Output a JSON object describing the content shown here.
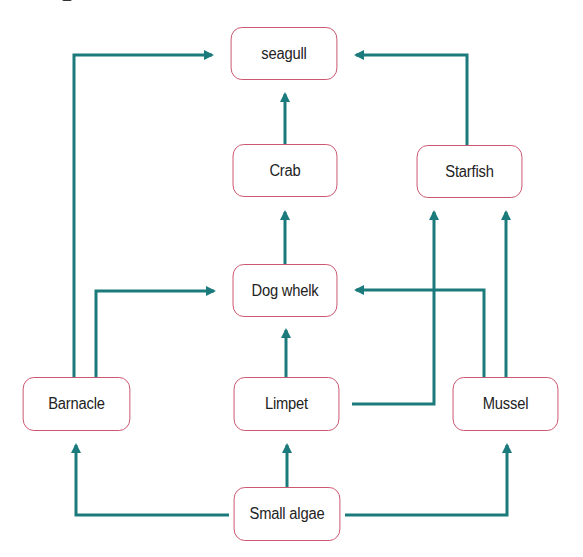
{
  "diagram": {
    "type": "food-web",
    "colors": {
      "arrow": "#1b7a7b",
      "node_border": "#c9506a",
      "node_fill": "#ffffff",
      "text": "#222222"
    },
    "nodes": [
      {
        "id": "seagull",
        "label": "seagull"
      },
      {
        "id": "crab",
        "label": "Crab"
      },
      {
        "id": "starfish",
        "label": "Starfish"
      },
      {
        "id": "dog_whelk",
        "label": "Dog whelk"
      },
      {
        "id": "barnacle",
        "label": "Barnacle"
      },
      {
        "id": "limpet",
        "label": "Limpet"
      },
      {
        "id": "mussel",
        "label": "Mussel"
      },
      {
        "id": "small_algae",
        "label": "Small algae"
      }
    ],
    "edges": [
      {
        "from": "Barnacle",
        "to": "seagull"
      },
      {
        "from": "Crab",
        "to": "seagull"
      },
      {
        "from": "Starfish",
        "to": "seagull"
      },
      {
        "from": "Dog whelk",
        "to": "Crab"
      },
      {
        "from": "Barnacle",
        "to": "Dog whelk"
      },
      {
        "from": "Limpet",
        "to": "Dog whelk"
      },
      {
        "from": "Mussel",
        "to": "Dog whelk"
      },
      {
        "from": "Limpet",
        "to": "Starfish"
      },
      {
        "from": "Mussel",
        "to": "Starfish"
      },
      {
        "from": "Small algae",
        "to": "Barnacle"
      },
      {
        "from": "Small algae",
        "to": "Limpet"
      },
      {
        "from": "Small algae",
        "to": "Mussel"
      }
    ]
  }
}
